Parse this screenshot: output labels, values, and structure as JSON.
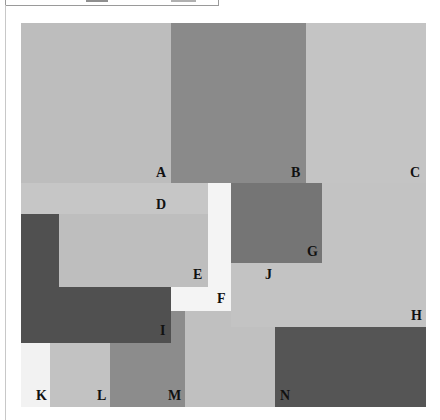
{
  "figure": {
    "type": "rectangle-partition diagram",
    "regions": [
      {
        "id": "A",
        "label": "A",
        "color": "#bdbdbd",
        "shade": "light gray"
      },
      {
        "id": "B",
        "label": "B",
        "color": "#8a8a8a",
        "shade": "medium gray"
      },
      {
        "id": "C",
        "label": "C",
        "color": "#c4c4c4",
        "shade": "light gray"
      },
      {
        "id": "D",
        "label": "D",
        "color": "#c6c6c6",
        "shade": "light gray"
      },
      {
        "id": "E",
        "label": "E",
        "color": "#bebebe",
        "shade": "light gray"
      },
      {
        "id": "F",
        "label": "F",
        "color": "#f4f4f4",
        "shade": "white"
      },
      {
        "id": "G",
        "label": "G",
        "color": "#757575",
        "shade": "dark gray"
      },
      {
        "id": "H",
        "label": "H",
        "color": "#c3c3c3",
        "shade": "light gray"
      },
      {
        "id": "I",
        "label": "I",
        "color": "#505050",
        "shade": "very dark gray"
      },
      {
        "id": "J",
        "label": "J",
        "color": "#c0c0c0",
        "shade": "light gray"
      },
      {
        "id": "K",
        "label": "K",
        "color": "#f2f2f2",
        "shade": "white"
      },
      {
        "id": "L",
        "label": "L",
        "color": "#c2c2c2",
        "shade": "light gray"
      },
      {
        "id": "M",
        "label": "M",
        "color": "#8c8c8c",
        "shade": "medium gray"
      },
      {
        "id": "N",
        "label": "N",
        "color": "#555555",
        "shade": "very dark gray"
      }
    ]
  }
}
